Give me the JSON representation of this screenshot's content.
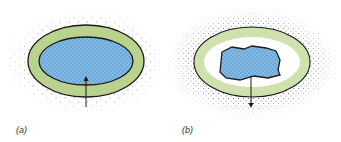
{
  "figure": {
    "panels": [
      {
        "id": "a",
        "label": "(a)",
        "description": "Cell with green wall ring and blue stippled cytoplasm filling interior; arrow points inward (upward)",
        "arrow_direction": "in"
      },
      {
        "id": "b",
        "label": "(b)",
        "description": "Cell with green wall ring, white gap, and shrunken irregular blue cytoplasm; arrow points outward (downward)",
        "arrow_direction": "out"
      }
    ],
    "colors": {
      "wall_green": "#b9d38f",
      "wall_light_green": "#cfe2ad",
      "cytoplasm_blue": "#7fb9e6",
      "outline": "#1a1a1a",
      "dots": "#555555",
      "background": "#ffffff"
    }
  }
}
